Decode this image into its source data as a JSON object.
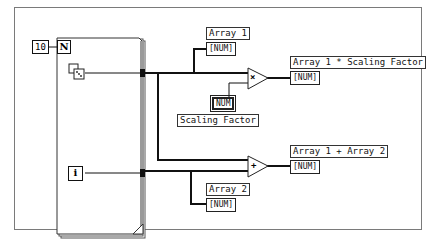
{
  "diagram": {
    "loop_count_constant": "10",
    "loop_count_terminal": "N",
    "iteration_terminal": "i",
    "random_icon": "dice-icon",
    "indicators": {
      "array1": {
        "label": "Array 1",
        "value": "[NUM]"
      },
      "array2": {
        "label": "Array 2",
        "value": "[NUM]"
      },
      "product": {
        "label": "Array 1 * Scaling Factor",
        "value": "[NUM]"
      },
      "sum": {
        "label": "Array 1 + Array 2",
        "value": "[NUM]"
      }
    },
    "controls": {
      "scaling_factor": {
        "label": "Scaling Factor",
        "value": "NUM"
      }
    },
    "functions": {
      "multiply": "×",
      "add": "+"
    },
    "colors": {
      "wire": "#111111",
      "loop_border": "#555555",
      "frame": "#7a7a7a"
    }
  }
}
